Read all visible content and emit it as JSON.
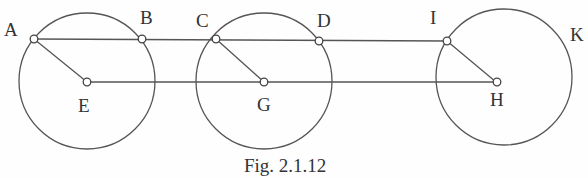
{
  "figure": {
    "caption": "Fig. 2.1.12",
    "labels": {
      "A": "A",
      "B": "B",
      "C": "C",
      "D": "D",
      "E": "E",
      "G": "G",
      "I": "I",
      "K": "K",
      "H": "H"
    },
    "colors": {
      "stroke": "#555555",
      "text": "#333333",
      "background": "#fefefe"
    }
  }
}
